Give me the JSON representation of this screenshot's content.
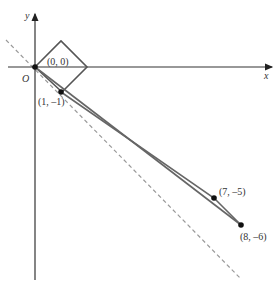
{
  "axes": {
    "x_label": "x",
    "y_label": "y",
    "origin_label": "O"
  },
  "points": [
    {
      "id": "p00",
      "label": "(0, 0)"
    },
    {
      "id": "p1",
      "label": "(1, –1)"
    },
    {
      "id": "p7",
      "label": "(7, –5)"
    },
    {
      "id": "p8",
      "label": "(8, –6)"
    }
  ],
  "colors": {
    "axis": "#333333",
    "path": "#555555",
    "dashed": "#999999"
  }
}
